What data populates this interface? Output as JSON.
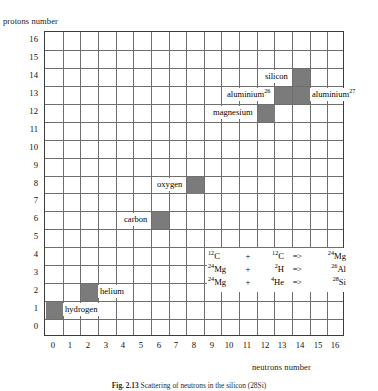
{
  "figure": {
    "caption_label": "Fig. 2.13",
    "caption_text": "Scattering of neutrons in the silicon (28Si)"
  },
  "axes": {
    "y_title": "protons number",
    "x_title": "neutrons number",
    "x_ticks": [
      "0",
      "1",
      "2",
      "3",
      "4",
      "5",
      "6",
      "7",
      "8",
      "9",
      "10",
      "11",
      "12",
      "13",
      "14",
      "15",
      "16"
    ],
    "y_ticks": [
      "16",
      "15",
      "14",
      "13",
      "12",
      "11",
      "10",
      "9",
      "8",
      "7",
      "6",
      "5",
      "4",
      "3",
      "2",
      "1",
      "0"
    ],
    "x_min": 0,
    "x_max": 16,
    "y_min": 0,
    "y_max": 16
  },
  "colors": {
    "shaded_cell": "#7b7b7b",
    "gridline": "#6e6e6e",
    "border": "#3c3c3c",
    "background": "#ffffff"
  },
  "chart_data": {
    "type": "heatmap",
    "title": "",
    "xlabel": "neutrons number",
    "ylabel": "protons number",
    "xlim": [
      0,
      16
    ],
    "ylim": [
      0,
      16
    ],
    "grid": true,
    "legend": "none",
    "cells": [
      {
        "name": "hydrogen",
        "label": "hydrogen",
        "sup": "",
        "neutrons": 0,
        "protons": 1,
        "shaded": true,
        "label_side": "right"
      },
      {
        "name": "helium",
        "label": "helium",
        "sup": "",
        "neutrons": 2,
        "protons": 2,
        "shaded": true,
        "label_side": "right"
      },
      {
        "name": "carbon",
        "label": "carbon",
        "sup": "",
        "neutrons": 6,
        "protons": 6,
        "shaded": true,
        "label_side": "left"
      },
      {
        "name": "oxygen",
        "label": "oxygen",
        "sup": "",
        "neutrons": 8,
        "protons": 8,
        "shaded": true,
        "label_side": "left"
      },
      {
        "name": "magnesium",
        "label": "magnesium",
        "sup": "",
        "neutrons": 12,
        "protons": 12,
        "shaded": true,
        "label_side": "left"
      },
      {
        "name": "aluminium-26",
        "label": "aluminium",
        "sup": "26",
        "neutrons": 13,
        "protons": 13,
        "shaded": true,
        "label_side": "left"
      },
      {
        "name": "aluminium-27",
        "label": "aluminium",
        "sup": "27",
        "neutrons": 14,
        "protons": 13,
        "shaded": true,
        "label_side": "right"
      },
      {
        "name": "silicon",
        "label": "silicon",
        "sup": "",
        "neutrons": 14,
        "protons": 14,
        "shaded": true,
        "label_side": "left"
      }
    ],
    "annotations": [
      {
        "name": "reaction-1",
        "a": "12C",
        "a_mass": "12",
        "a_sym": "C",
        "op": "+",
        "b": "12C",
        "b_mass": "12",
        "b_sym": "C",
        "arrow": "=>",
        "c": "24Mg",
        "c_mass": "24",
        "c_sym": "Mg"
      },
      {
        "name": "reaction-2",
        "a": "24Mg",
        "a_mass": "24",
        "a_sym": "Mg",
        "op": "+",
        "b": "2H",
        "b_mass": "2",
        "b_sym": "H",
        "arrow": "=>",
        "c": "26Al",
        "c_mass": "26",
        "c_sym": "Al"
      },
      {
        "name": "reaction-3",
        "a": "24Mg",
        "a_mass": "24",
        "a_sym": "Mg",
        "op": "+",
        "b": "4He",
        "b_mass": "4",
        "b_sym": "He",
        "arrow": "=>",
        "c": "28Si",
        "c_mass": "28",
        "c_sym": "Si"
      }
    ]
  }
}
